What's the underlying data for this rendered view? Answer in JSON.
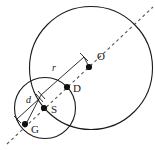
{
  "figure": {
    "background_color": "#ffffff",
    "line_color": "#1a1a1a",
    "dashed_line_color": "#555555",
    "point_color": "#111111",
    "width": 155,
    "height": 150
  },
  "points": [
    {
      "id": "O",
      "label": "O",
      "cx": 89,
      "cy": 67,
      "r": 3.1,
      "label_x": 97,
      "label_y": 60
    },
    {
      "id": "D",
      "label": "D",
      "cx": 67,
      "cy": 87,
      "r": 3.1,
      "label_x": 73,
      "label_y": 92
    },
    {
      "id": "S",
      "label": "S",
      "cx": 44,
      "cy": 108,
      "r": 3.1,
      "label_x": 51,
      "label_y": 113
    },
    {
      "id": "G",
      "label": "G",
      "cx": 25,
      "cy": 124,
      "r": 3.1,
      "label_x": 31,
      "label_y": 133
    }
  ],
  "circles": [
    {
      "id": "large-circle",
      "center_label": "O",
      "cx": 91,
      "cy": 68,
      "r": 61.5
    },
    {
      "id": "small-circle",
      "center_label": "S",
      "cx": 45,
      "cy": 108,
      "r": 30.5
    }
  ],
  "dimensions": [
    {
      "id": "r",
      "label": "r",
      "meaning": "radius of large circle",
      "label_x": 52,
      "label_y": 71,
      "start_x": 41,
      "start_y": 95,
      "end_x": 84,
      "end_y": 57,
      "tick_start": {
        "x1": 38,
        "y1": 91,
        "x2": 45,
        "y2": 99
      },
      "tick_end": {
        "x1": 80,
        "y1": 53,
        "x2": 88,
        "y2": 61
      }
    },
    {
      "id": "d",
      "label": "d",
      "meaning": "distance from G to S",
      "label_x": 26,
      "label_y": 103,
      "start_x": 17,
      "start_y": 119,
      "end_x": 40,
      "end_y": 98,
      "tick_start": {
        "x1": 14,
        "y1": 116,
        "x2": 21,
        "y2": 123
      },
      "tick_end": {
        "x1": 36,
        "y1": 94,
        "x2": 43,
        "y2": 102
      }
    }
  ],
  "dashed_axis": {
    "id": "center-line",
    "x1": 7,
    "y1": 144,
    "x2": 153,
    "y2": 7,
    "description": "dashed line through G, S, D and O"
  }
}
